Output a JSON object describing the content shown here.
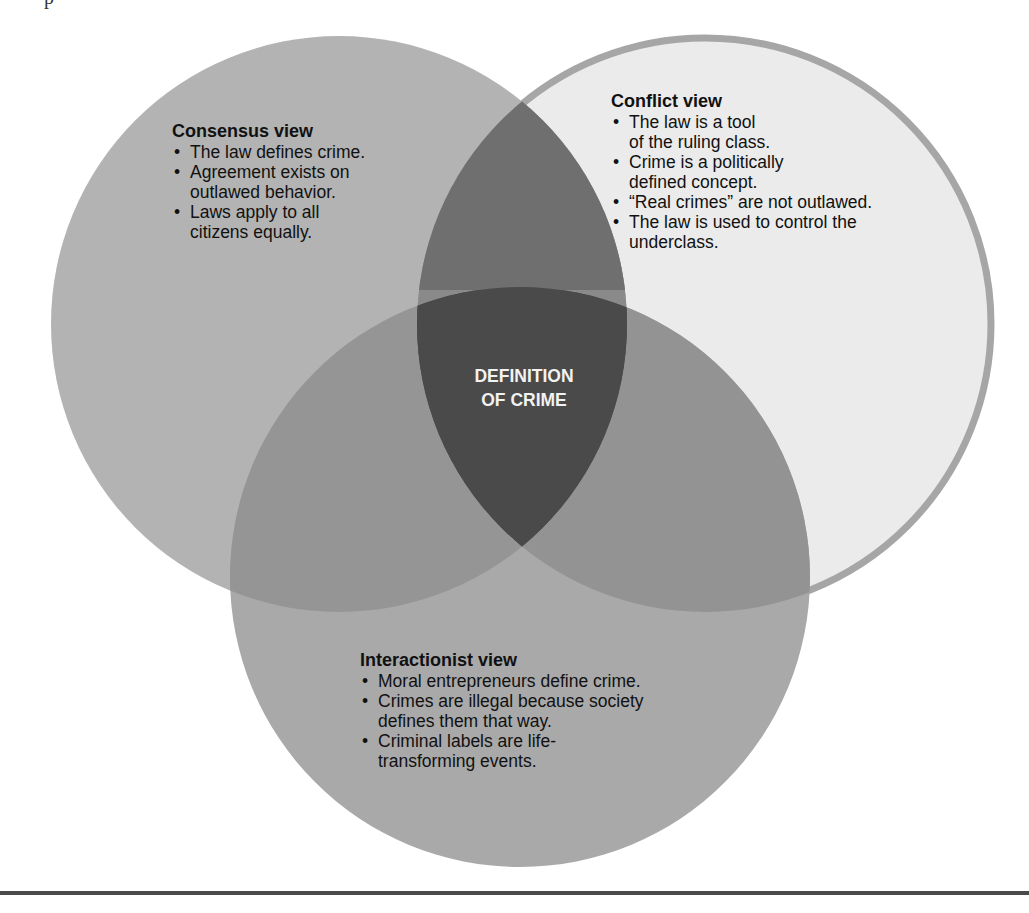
{
  "diagram": {
    "type": "venn",
    "center_label": {
      "line1": "DEFINITION",
      "line2": "OF CRIME"
    },
    "circles": [
      {
        "id": "consensus",
        "title": "Consensus view",
        "bullets": [
          "The law defines crime.",
          "Agreement exists on outlawed behavior.",
          "Laws apply to all citizens equally."
        ],
        "fill": "#b3b3b3"
      },
      {
        "id": "conflict",
        "title": "Conflict view",
        "bullets": [
          "The law is a tool of the ruling class.",
          "Crime is a politically defined concept.",
          "“Real crimes” are not outlawed.",
          "The law is used to control the underclass."
        ],
        "fill": "#ebebeb",
        "outline": "#a6a6a6"
      },
      {
        "id": "interactionist",
        "title": "Interactionist view",
        "bullets": [
          "Moral entrepreneurs define crime.",
          "Crimes are illegal because society defines them that way.",
          "Criminal labels are life-transforming events."
        ],
        "fill": "#a9a9a9"
      }
    ],
    "overlap_colors": {
      "consensus_conflict": "#8a8a8a",
      "consensus_interactionist": "#959595",
      "conflict_interactionist": "#939393",
      "all_three": "#4a4a4a"
    }
  },
  "lines": {
    "consensus": [
      "The law defines crime.",
      "Agreement exists on",
      "outlawed behavior.",
      "Laws apply to all",
      "citizens equally."
    ],
    "conflict": [
      "The law is a tool",
      "of the ruling class.",
      "Crime is a politically",
      "defined concept.",
      "“Real crimes” are not outlawed.",
      "The law is used to control the",
      "underclass."
    ],
    "interactionist": [
      "Moral entrepreneurs define crime.",
      "Crimes are illegal because society",
      "defines them that way.",
      "Criminal labels are life-",
      "transforming events."
    ]
  }
}
